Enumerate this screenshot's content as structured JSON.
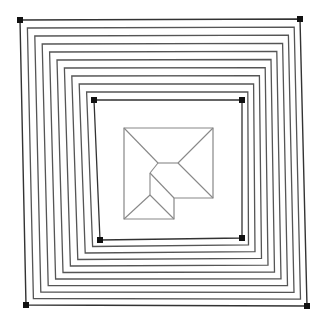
{
  "diagram": {
    "canvas": {
      "width": 319,
      "height": 321,
      "background": "#ffffff"
    },
    "colors": {
      "stroke_outer": "#333333",
      "stroke_rings": "#555555",
      "stroke_skeleton": "#888888",
      "vertex_marker": "#111111"
    },
    "outer_square": {
      "corners": [
        [
          20,
          20
        ],
        [
          300,
          19
        ],
        [
          307,
          306
        ],
        [
          26,
          305
        ]
      ]
    },
    "inner_square": {
      "corners": [
        [
          94,
          100
        ],
        [
          242,
          100
        ],
        [
          242,
          238
        ],
        [
          100,
          240
        ]
      ]
    },
    "ring_count_between": 9,
    "center_polygon": {
      "outline": [
        [
          124,
          128
        ],
        [
          213,
          128
        ],
        [
          213,
          198
        ],
        [
          174,
          198
        ],
        [
          174,
          219
        ],
        [
          124,
          219
        ]
      ],
      "skeleton_nodes": {
        "A": [
          158,
          163
        ],
        "B": [
          178,
          163
        ],
        "C": [
          150,
          173
        ],
        "D": [
          150,
          195
        ]
      },
      "skeleton_edges": [
        [
          [
            124,
            128
          ],
          [
            158,
            163
          ]
        ],
        [
          [
            213,
            128
          ],
          [
            178,
            163
          ]
        ],
        [
          [
            158,
            163
          ],
          [
            178,
            163
          ]
        ],
        [
          [
            158,
            163
          ],
          [
            150,
            173
          ]
        ],
        [
          [
            150,
            173
          ],
          [
            150,
            195
          ]
        ],
        [
          [
            178,
            163
          ],
          [
            213,
            198
          ]
        ],
        [
          [
            150,
            173
          ],
          [
            174,
            198
          ]
        ],
        [
          [
            150,
            195
          ],
          [
            124,
            219
          ]
        ],
        [
          [
            150,
            195
          ],
          [
            174,
            219
          ]
        ]
      ]
    }
  }
}
